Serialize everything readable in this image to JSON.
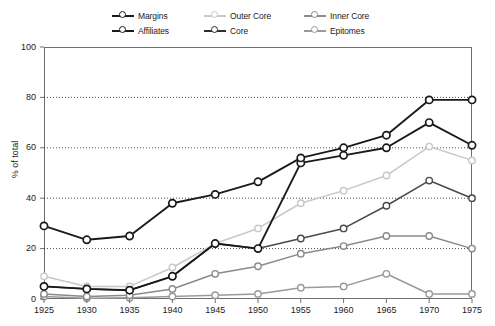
{
  "chart_data": {
    "type": "line",
    "title": "",
    "xlabel": "",
    "ylabel": "% of total",
    "xlim": [
      1925,
      1975
    ],
    "ylim": [
      0,
      100
    ],
    "grid": "horizontal-dotted",
    "legend_position": "top",
    "x": [
      1925,
      1930,
      1935,
      1940,
      1945,
      1950,
      1955,
      1960,
      1965,
      1970,
      1975
    ],
    "xtick_labels": [
      "1925",
      "1930",
      "1935",
      "1940",
      "1945",
      "1950",
      "1955",
      "1960",
      "1965",
      "1970",
      "1975"
    ],
    "ytick_labels": [
      "0",
      "20",
      "40",
      "60",
      "80",
      "100"
    ],
    "ytick_values": [
      0,
      20,
      40,
      60,
      80,
      100
    ],
    "series": [
      {
        "name": "Margins",
        "color": "#1a1a1a",
        "values": [
          29,
          23.5,
          25,
          38,
          41.5,
          46.5,
          56,
          60,
          65,
          79,
          79
        ]
      },
      {
        "name": "Affiliates",
        "color": "#1a1a1a",
        "values": [
          5,
          4,
          3.5,
          9,
          22,
          20,
          54,
          57,
          60,
          70,
          61
        ]
      },
      {
        "name": "Outer Core",
        "color": "#c8c8c8",
        "values": [
          9,
          5,
          5,
          12.5,
          22,
          28,
          38,
          43,
          49,
          60.5,
          55
        ]
      },
      {
        "name": "Core",
        "color": "#4a4a4a",
        "values": [
          5,
          4,
          3.5,
          9,
          22,
          20,
          24,
          28,
          37,
          47,
          40
        ]
      },
      {
        "name": "Inner Core",
        "color": "#8a8a8a",
        "values": [
          2,
          1,
          1.5,
          4,
          10,
          13,
          18,
          21,
          25,
          25,
          20
        ]
      },
      {
        "name": "Epitomes",
        "color": "#9a9a9a",
        "values": [
          1,
          0.3,
          0.5,
          1,
          1.5,
          2,
          4.5,
          5,
          10,
          2,
          2
        ]
      }
    ]
  },
  "legend": {
    "items": [
      {
        "label": "Margins",
        "marker": "circle-line-marker",
        "color": "#1a1a1a"
      },
      {
        "label": "Affiliates",
        "marker": "circle-line-marker",
        "color": "#1a1a1a"
      },
      {
        "label": "Outer Core",
        "marker": "circle-line-marker",
        "color": "#c8c8c8"
      },
      {
        "label": "Core",
        "marker": "circle-line-marker",
        "color": "#2e2e2e"
      },
      {
        "label": "Inner Core",
        "marker": "circle-line-marker",
        "color": "#8a8a8a"
      },
      {
        "label": "Epitomes",
        "marker": "circle-line-marker",
        "color": "#9a9a9a"
      }
    ]
  },
  "axes": {
    "y_title": "% of total",
    "y_ticks": [
      "100",
      "80",
      "60",
      "40",
      "20",
      "0"
    ],
    "x_ticks": [
      "1925",
      "1930",
      "1935",
      "1940",
      "1945",
      "1950",
      "1955",
      "1960",
      "1965",
      "1970",
      "1975"
    ]
  }
}
